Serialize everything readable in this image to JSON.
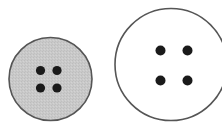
{
  "scene": {
    "width": 222,
    "height": 126,
    "background": "#ffffff"
  },
  "buttons": [
    {
      "name": "small-gray-button",
      "cx": 50.5,
      "cy": 79,
      "r": 41.5,
      "fill": "#c8c8c8",
      "stroke": "#555555",
      "holes": [
        {
          "cx": 40.5,
          "cy": 70.5,
          "r": 4.6
        },
        {
          "cx": 57,
          "cy": 70.5,
          "r": 4.6
        },
        {
          "cx": 40.5,
          "cy": 88,
          "r": 4.6
        },
        {
          "cx": 57,
          "cy": 88,
          "r": 4.6
        }
      ]
    },
    {
      "name": "large-white-button",
      "cx": 171,
      "cy": 64.5,
      "r": 56,
      "fill": "#ffffff",
      "stroke": "#555555",
      "holes": [
        {
          "cx": 160.5,
          "cy": 50.5,
          "r": 5
        },
        {
          "cx": 187.5,
          "cy": 50.5,
          "r": 5
        },
        {
          "cx": 160.5,
          "cy": 80.5,
          "r": 5
        },
        {
          "cx": 187.5,
          "cy": 80.5,
          "r": 5
        }
      ]
    }
  ],
  "hole_color": "#1a1a1a"
}
